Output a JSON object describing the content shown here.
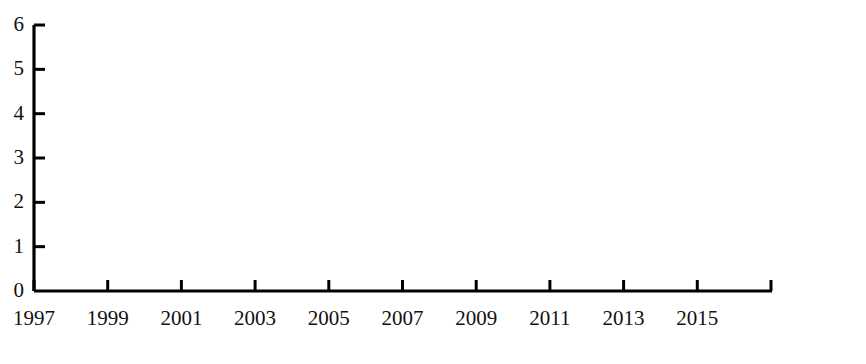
{
  "chart_data": {
    "type": "line",
    "title": "",
    "subtitle": "",
    "xlabel": "(年份)",
    "ylabel": "",
    "xlim": [
      1997,
      2017
    ],
    "ylim": [
      0,
      6
    ],
    "grid": false,
    "legend": null,
    "x": [
      1997,
      1998,
      1999,
      2000,
      2001,
      2002,
      2003,
      2004,
      2005,
      2006,
      2007,
      2008,
      2009,
      2010,
      2011,
      2012,
      2013,
      2014,
      2015,
      2016
    ],
    "values": [
      0,
      0,
      0,
      0,
      0,
      0,
      0,
      0,
      0,
      1.6,
      0,
      0,
      2.6,
      5.2,
      4.0,
      2.85,
      2.85,
      5.2,
      4.0,
      2.85
    ],
    "series": [
      {
        "name": "数量",
        "color": "#000000",
        "values": [
          0,
          0,
          0,
          0,
          0,
          0,
          0,
          0,
          0,
          1.6,
          0,
          0,
          2.6,
          5.2,
          4.0,
          2.85,
          2.85,
          5.2,
          4.0,
          2.85
        ]
      }
    ],
    "x_tick_labels": [
      "1997",
      "1999",
      "2001",
      "2003",
      "2005",
      "2007",
      "2009",
      "2011",
      "2013",
      "2015",
      "2017"
    ],
    "x_tick_values": [
      1997,
      1999,
      2001,
      2003,
      2005,
      2007,
      2009,
      2011,
      2013,
      2015,
      2017
    ],
    "y_tick_labels": [
      "0",
      "1",
      "2",
      "3",
      "4",
      "5",
      "6"
    ],
    "y_tick_values": [
      0,
      1,
      2,
      3,
      4,
      5,
      6
    ],
    "axis_color": "#000000",
    "line_color": "#000000"
  },
  "axis": {
    "x_unit_label": "(年份)",
    "x_last_tick": "2017"
  }
}
